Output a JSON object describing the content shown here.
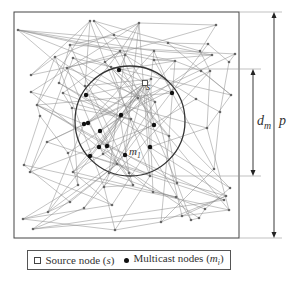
{
  "figure": {
    "area_box": {
      "x": 14,
      "y": 12,
      "w": 225,
      "h": 226
    },
    "circle": {
      "cx": 130,
      "cy": 121,
      "r": 55
    },
    "colors": {
      "edge": "#8a8a8a",
      "node": "#666666",
      "multicast": "#111111",
      "frame": "#444444",
      "circle": "#333333"
    },
    "dimensions": {
      "p": {
        "label": "p",
        "x": 274,
        "y1": 12,
        "y2": 238
      },
      "dm": {
        "label": "d",
        "sub": "m",
        "x": 253,
        "y1": 69,
        "y2": 176
      }
    },
    "labels": {
      "source": {
        "text": "s",
        "x": 146,
        "y": 90
      },
      "m1": {
        "text": "m",
        "sub": "1",
        "x": 129,
        "y": 157
      }
    }
  },
  "legend": {
    "source_label": "Source node (",
    "source_sym": "s",
    "source_close": ")",
    "multicast_label": "Multicast nodes (",
    "multicast_sym": "m",
    "multicast_sub": "i",
    "multicast_close": ")"
  },
  "nodes": [
    [
      18,
      30
    ],
    [
      90,
      21
    ],
    [
      94,
      21
    ],
    [
      139,
      23
    ],
    [
      216,
      25
    ],
    [
      114,
      35
    ],
    [
      70,
      45
    ],
    [
      168,
      43
    ],
    [
      208,
      44
    ],
    [
      55,
      57
    ],
    [
      154,
      51
    ],
    [
      200,
      51
    ],
    [
      212,
      55
    ],
    [
      235,
      54
    ],
    [
      31,
      75
    ],
    [
      73,
      58
    ],
    [
      105,
      62
    ],
    [
      120,
      51
    ],
    [
      125,
      55
    ],
    [
      154,
      60
    ],
    [
      175,
      61
    ],
    [
      229,
      62
    ],
    [
      67,
      68
    ],
    [
      201,
      71
    ],
    [
      210,
      71
    ],
    [
      59,
      83
    ],
    [
      111,
      67
    ],
    [
      85,
      86
    ],
    [
      31,
      92
    ],
    [
      63,
      93
    ],
    [
      151,
      79
    ],
    [
      37,
      105
    ],
    [
      72,
      108
    ],
    [
      138,
      98
    ],
    [
      196,
      99
    ],
    [
      231,
      95
    ],
    [
      220,
      112
    ],
    [
      40,
      116
    ],
    [
      120,
      117
    ],
    [
      131,
      119
    ],
    [
      47,
      142
    ],
    [
      155,
      102
    ],
    [
      207,
      128
    ],
    [
      68,
      153
    ],
    [
      24,
      165
    ],
    [
      30,
      172
    ],
    [
      169,
      136
    ],
    [
      103,
      154
    ],
    [
      151,
      148
    ],
    [
      117,
      164
    ],
    [
      109,
      173
    ],
    [
      214,
      169
    ],
    [
      150,
      176
    ],
    [
      73,
      172
    ],
    [
      78,
      185
    ],
    [
      70,
      202
    ],
    [
      104,
      187
    ],
    [
      177,
      183
    ],
    [
      230,
      188
    ],
    [
      224,
      200
    ],
    [
      129,
      173
    ],
    [
      153,
      192
    ],
    [
      191,
      220
    ],
    [
      229,
      210
    ],
    [
      48,
      212
    ],
    [
      84,
      208
    ],
    [
      112,
      205
    ],
    [
      23,
      219
    ],
    [
      33,
      229
    ],
    [
      115,
      230
    ],
    [
      182,
      216
    ],
    [
      199,
      218
    ],
    [
      161,
      222
    ],
    [
      226,
      196
    ],
    [
      205,
      209
    ],
    [
      133,
      185
    ],
    [
      176,
      197
    ]
  ],
  "multicast_nodes": [
    [
      119,
      70
    ],
    [
      172,
      93
    ],
    [
      86,
      95
    ],
    [
      121,
      115
    ],
    [
      84,
      124
    ],
    [
      100,
      131
    ],
    [
      154,
      125
    ],
    [
      99,
      147
    ],
    [
      107,
      146
    ],
    [
      150,
      147
    ],
    [
      90,
      156
    ],
    [
      125,
      155
    ],
    [
      88,
      123
    ]
  ],
  "source_node": [
    145,
    83
  ],
  "edges": [
    [
      0,
      7
    ],
    [
      0,
      10
    ],
    [
      0,
      19
    ],
    [
      0,
      20
    ],
    [
      0,
      26
    ],
    [
      1,
      14
    ],
    [
      1,
      27
    ],
    [
      1,
      16
    ],
    [
      2,
      5
    ],
    [
      2,
      33
    ],
    [
      3,
      4
    ],
    [
      3,
      9
    ],
    [
      3,
      28
    ],
    [
      4,
      11
    ],
    [
      4,
      22
    ],
    [
      5,
      6
    ],
    [
      5,
      12
    ],
    [
      6,
      13
    ],
    [
      6,
      25
    ],
    [
      7,
      8
    ],
    [
      7,
      35
    ],
    [
      8,
      21
    ],
    [
      9,
      14
    ],
    [
      9,
      31
    ],
    [
      10,
      12
    ],
    [
      10,
      30
    ],
    [
      11,
      24
    ],
    [
      12,
      19
    ],
    [
      13,
      21
    ],
    [
      14,
      18
    ],
    [
      15,
      33
    ],
    [
      15,
      45
    ],
    [
      16,
      17
    ],
    [
      16,
      39
    ],
    [
      17,
      3
    ],
    [
      17,
      29
    ],
    [
      18,
      34
    ],
    [
      19,
      20
    ],
    [
      19,
      51
    ],
    [
      20,
      23
    ],
    [
      21,
      36
    ],
    [
      22,
      41
    ],
    [
      22,
      47
    ],
    [
      23,
      35
    ],
    [
      24,
      42
    ],
    [
      25,
      38
    ],
    [
      25,
      58
    ],
    [
      26,
      41
    ],
    [
      26,
      52
    ],
    [
      27,
      30
    ],
    [
      27,
      49
    ],
    [
      28,
      39
    ],
    [
      28,
      61
    ],
    [
      29,
      32
    ],
    [
      29,
      46
    ],
    [
      30,
      48
    ],
    [
      30,
      64
    ],
    [
      31,
      37
    ],
    [
      31,
      57
    ],
    [
      32,
      39
    ],
    [
      32,
      54
    ],
    [
      33,
      40
    ],
    [
      33,
      46
    ],
    [
      34,
      36
    ],
    [
      34,
      53
    ],
    [
      35,
      42
    ],
    [
      36,
      51
    ],
    [
      37,
      43
    ],
    [
      37,
      44
    ],
    [
      38,
      47
    ],
    [
      38,
      60
    ],
    [
      39,
      62
    ],
    [
      39,
      56
    ],
    [
      40,
      45
    ],
    [
      40,
      59
    ],
    [
      41,
      50
    ],
    [
      41,
      70
    ],
    [
      42,
      63
    ],
    [
      43,
      54
    ],
    [
      44,
      55
    ],
    [
      44,
      63
    ],
    [
      45,
      66
    ],
    [
      46,
      57
    ],
    [
      46,
      72
    ],
    [
      47,
      71
    ],
    [
      48,
      61
    ],
    [
      48,
      73
    ],
    [
      49,
      55
    ],
    [
      49,
      68
    ],
    [
      50,
      65
    ],
    [
      50,
      74
    ],
    [
      51,
      72
    ],
    [
      52,
      69
    ],
    [
      53,
      66
    ],
    [
      53,
      76
    ],
    [
      54,
      67
    ],
    [
      55,
      64
    ],
    [
      56,
      69
    ],
    [
      56,
      75
    ],
    [
      57,
      62
    ],
    [
      58,
      74
    ],
    [
      59,
      68
    ],
    [
      60,
      75
    ],
    [
      61,
      76
    ],
    [
      62,
      71
    ],
    [
      63,
      70
    ],
    [
      64,
      67
    ],
    [
      65,
      68
    ],
    [
      66,
      67
    ],
    [
      67,
      69
    ],
    [
      68,
      70
    ],
    [
      69,
      72
    ],
    [
      70,
      73
    ],
    [
      71,
      74
    ],
    [
      72,
      73
    ],
    [
      2,
      11
    ],
    [
      1,
      31
    ],
    [
      5,
      41
    ],
    [
      15,
      35
    ],
    [
      18,
      50
    ],
    [
      6,
      60
    ],
    [
      9,
      56
    ],
    [
      26,
      63
    ],
    [
      16,
      58
    ],
    [
      0,
      38
    ],
    [
      8,
      49
    ],
    [
      12,
      43
    ],
    [
      24,
      65
    ],
    [
      20,
      46
    ],
    [
      13,
      40
    ],
    [
      3,
      52
    ],
    [
      17,
      57
    ]
  ]
}
